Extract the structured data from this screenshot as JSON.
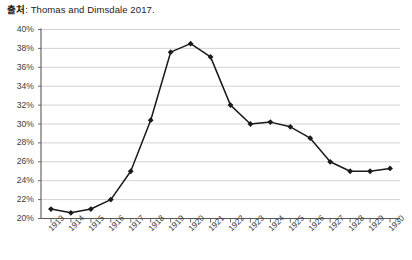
{
  "source_note": {
    "label": "출처",
    "separator": ": ",
    "text": "Thomas and Dimsdale 2017."
  },
  "chart_data": {
    "type": "line",
    "title": "",
    "xlabel": "",
    "ylabel": "",
    "grid": true,
    "legend": "none",
    "ylim": [
      20,
      40
    ],
    "ytick_labels": [
      "40%",
      "38%",
      "36%",
      "34%",
      "32%",
      "30%",
      "28%",
      "26%",
      "24%",
      "22%",
      "20%"
    ],
    "ytick_values": [
      40,
      38,
      36,
      34,
      32,
      30,
      28,
      26,
      24,
      22,
      20
    ],
    "categories": [
      "1913",
      "1914",
      "1915",
      "1916",
      "1917",
      "1918",
      "1919",
      "1920",
      "1921",
      "1922",
      "1923",
      "1924",
      "1925",
      "1926",
      "1927",
      "1928",
      "1929",
      "1930"
    ],
    "values": [
      21.0,
      20.6,
      21.0,
      22.0,
      25.0,
      30.4,
      37.6,
      38.5,
      37.1,
      32.0,
      30.0,
      30.2,
      29.7,
      28.5,
      26.0,
      25.0,
      25.0,
      25.3
    ],
    "marker": "diamond",
    "line_color": "#1a1a1a",
    "marker_color": "#1a1a1a",
    "grid_color": "#c8c8c8",
    "axis_color": "#595959"
  }
}
